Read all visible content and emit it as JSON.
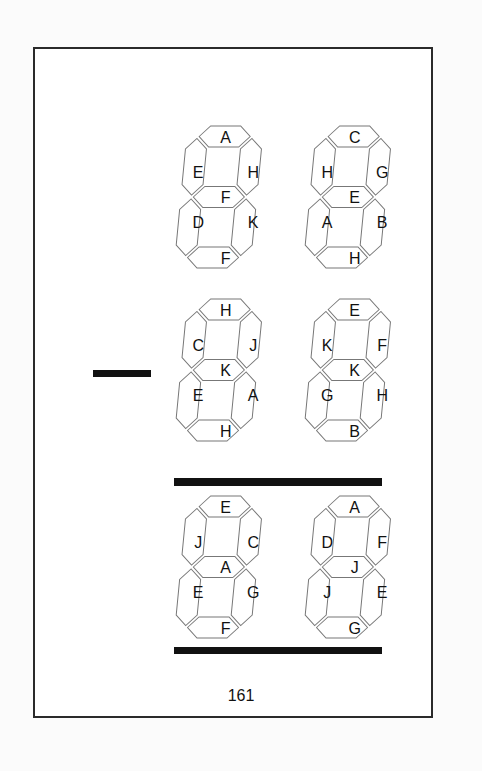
{
  "page": {
    "page_number": "161",
    "colors": {
      "segment_stroke": "#777777",
      "ink": "#111111",
      "frame": "#2a2a2a"
    }
  },
  "puzzle": {
    "minus_sign": true,
    "rows": [
      {
        "digits": [
          {
            "top": "A",
            "upper_left": "E",
            "upper_right": "H",
            "middle": "F",
            "lower_left": "D",
            "lower_right": "K",
            "bottom": "F"
          },
          {
            "top": "C",
            "upper_left": "H",
            "upper_right": "G",
            "middle": "E",
            "lower_left": "A",
            "lower_right": "B",
            "bottom": "H"
          }
        ]
      },
      {
        "operator": "minus",
        "digits": [
          {
            "top": "H",
            "upper_left": "C",
            "upper_right": "J",
            "middle": "K",
            "lower_left": "E",
            "lower_right": "A",
            "bottom": "H"
          },
          {
            "top": "E",
            "upper_left": "K",
            "upper_right": "F",
            "middle": "K",
            "lower_left": "G",
            "lower_right": "H",
            "bottom": "B"
          }
        ]
      },
      {
        "digits": [
          {
            "top": "E",
            "upper_left": "J",
            "upper_right": "C",
            "middle": "A",
            "lower_left": "E",
            "lower_right": "G",
            "bottom": "F"
          },
          {
            "top": "A",
            "upper_left": "D",
            "upper_right": "F",
            "middle": "J",
            "lower_left": "J",
            "lower_right": "E",
            "bottom": "G"
          }
        ]
      }
    ]
  }
}
